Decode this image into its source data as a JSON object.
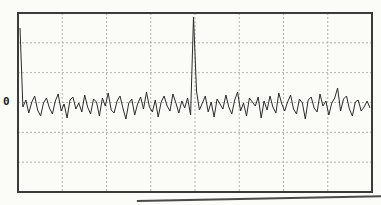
{
  "chart_data": {
    "type": "line",
    "title": "",
    "baseline_label": "0",
    "legend": null,
    "grid": {
      "columns": 8,
      "rows": 6,
      "style": "dashed",
      "visible": true
    },
    "frame": {
      "left": 18,
      "top": 13,
      "width": 354,
      "height": 179
    },
    "trace": {
      "baseline_y": 105,
      "x_start": 20,
      "x_end": 370,
      "unit": "px offset above 0 baseline",
      "values": [
        77,
        -2,
        5,
        -8,
        3,
        9,
        -5,
        -11,
        2,
        7,
        -3,
        -9,
        4,
        11,
        -6,
        1,
        -13,
        5,
        8,
        -4,
        2,
        -7,
        10,
        -2,
        -9,
        6,
        3,
        -11,
        7,
        -1,
        12,
        -5,
        -8,
        4,
        9,
        -3,
        -14,
        2,
        6,
        -10,
        1,
        8,
        -4,
        13,
        -2,
        -7,
        5,
        -12,
        3,
        9,
        -1,
        -6,
        11,
        2,
        -8,
        4,
        -3,
        7,
        -10,
        88,
        14,
        -5,
        2,
        9,
        -7,
        3,
        -12,
        6,
        1,
        -4,
        10,
        -2,
        -9,
        5,
        13,
        -6,
        2,
        -11,
        7,
        3,
        -1,
        8,
        -13,
        4,
        -5,
        9,
        -2,
        -8,
        12,
        1,
        -6,
        3,
        10,
        -4,
        -9,
        6,
        2,
        -14,
        5,
        8,
        -3,
        -7,
        11,
        -1,
        4,
        -10,
        2,
        7,
        17,
        -6,
        6,
        9,
        -4,
        -11,
        3,
        5,
        -6,
        -2,
        4,
        -3
      ]
    },
    "spikes": [
      {
        "name": "dc-spike",
        "x": 20,
        "top_y": 28
      },
      {
        "name": "signal-spike",
        "x": 193,
        "top_y": 17
      }
    ],
    "colors": {
      "background": "#fbfbf8",
      "frame": "#3b3b39",
      "grid": "#b2b1ac",
      "trace": "#2c2c2a",
      "label": "#1e1e1c"
    }
  }
}
